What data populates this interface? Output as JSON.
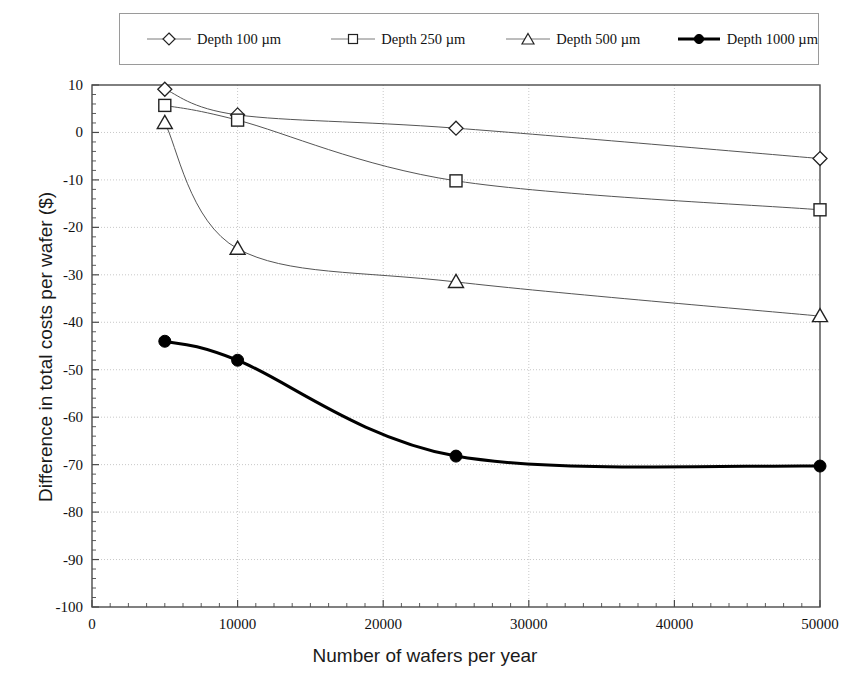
{
  "chart_data": {
    "type": "line",
    "title": "",
    "xlabel": "Number of wafers per year",
    "ylabel": "Difference in total costs per wafer ($)",
    "x": [
      5000,
      10000,
      25000,
      50000
    ],
    "xlim": [
      0,
      50000
    ],
    "ylim": [
      -100,
      10
    ],
    "xticks": [
      0,
      10000,
      20000,
      30000,
      40000,
      50000
    ],
    "xtick_labels": [
      "0",
      "10000",
      "20000",
      "30000",
      "40000",
      "50000"
    ],
    "yticks": [
      10,
      0,
      -10,
      -20,
      -30,
      -40,
      -50,
      -60,
      -70,
      -80,
      -90,
      -100
    ],
    "ytick_labels": [
      "10",
      "0",
      "-10",
      "-20",
      "-30",
      "-40",
      "-50",
      "-60",
      "-70",
      "-80",
      "-90",
      "-100"
    ],
    "grid": "horizontal-and-vertical-dotted",
    "legend_position": "top-outside",
    "series": [
      {
        "name": "Depth 100 µm",
        "marker": "diamond-open",
        "color": "#333333",
        "linewidth": 1,
        "values": [
          9.1,
          3.7,
          0.9,
          -5.5
        ]
      },
      {
        "name": "Depth 250 µm",
        "marker": "square-open",
        "color": "#333333",
        "linewidth": 1,
        "values": [
          5.7,
          2.6,
          -10.2,
          -16.3
        ]
      },
      {
        "name": "Depth 500 µm",
        "marker": "triangle-open",
        "color": "#333333",
        "linewidth": 1,
        "values": [
          2.0,
          -24.5,
          -31.5,
          -38.7
        ]
      },
      {
        "name": "Depth 1000 µm",
        "marker": "circle-filled",
        "color": "#000000",
        "linewidth": 3,
        "values": [
          -44.0,
          -48.0,
          -68.2,
          -70.3
        ]
      }
    ]
  },
  "legend": {
    "items": [
      {
        "label": "Depth 100 µm"
      },
      {
        "label": "Depth 250 µm"
      },
      {
        "label": "Depth 500 µm"
      },
      {
        "label": "Depth 1000 µm"
      }
    ]
  },
  "axes": {
    "x_title": "Number of wafers per year",
    "y_title": "Difference in total costs per wafer ($)",
    "x_labels": [
      "0",
      "10000",
      "20000",
      "30000",
      "40000",
      "50000"
    ],
    "y_labels": [
      "10",
      "0",
      "-10",
      "-20",
      "-30",
      "-40",
      "-50",
      "-60",
      "-70",
      "-80",
      "-90",
      "-100"
    ]
  },
  "colors": {
    "axis": "#4a4a4a",
    "grid": "#c8c8c8",
    "thin_series": "#555555",
    "thick_series": "#000000",
    "text": "#111111"
  }
}
